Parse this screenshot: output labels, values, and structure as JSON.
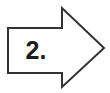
{
  "figure": {
    "name": "numbered-right-arrow",
    "shape": "right-arrow-outline",
    "label": "2.",
    "label_color": "#1c1c1c",
    "outline_color": "#333333",
    "fill_color": "#ffffff",
    "background_color": "#ffffff",
    "stroke_width": "2",
    "canvas_width": "110",
    "canvas_height": "93",
    "points": "8,28 62,28 62,8 104,48 62,87 62,73 8,73"
  }
}
